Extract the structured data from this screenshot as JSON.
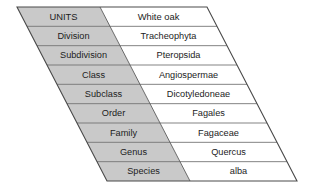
{
  "diagram": {
    "columns": [
      "UNITS",
      "White oak"
    ],
    "shape": "parallelogram",
    "fill_label_color": "#c9c9c9",
    "fill_value_color": "#ffffff",
    "line_color": "#5a5a5a",
    "text_color": "#1c1c1c",
    "rows": [
      {
        "unit": "UNITS",
        "value": "White oak",
        "header": true
      },
      {
        "unit": "Division",
        "value": "Tracheophyta",
        "header": false
      },
      {
        "unit": "Subdivision",
        "value": "Pteropsida",
        "header": false
      },
      {
        "unit": "Class",
        "value": "Angiospermae",
        "header": false
      },
      {
        "unit": "Subclass",
        "value": "Dicotyledoneae",
        "header": false
      },
      {
        "unit": "Order",
        "value": "Fagales",
        "header": false
      },
      {
        "unit": "Family",
        "value": "Fagaceae",
        "header": false
      },
      {
        "unit": "Genus",
        "value": "Quercus",
        "header": false
      },
      {
        "unit": "Species",
        "value": "alba",
        "header": false
      }
    ],
    "geometry": {
      "top_left_x": 17,
      "top_y": 7,
      "bottom_y": 181,
      "shear_dx": 90,
      "divider_top_x": 100,
      "right_top_x": 207,
      "row_count": 9
    }
  }
}
